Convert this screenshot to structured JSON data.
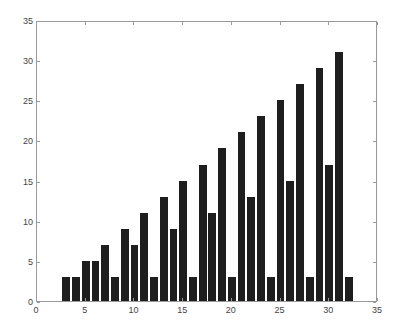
{
  "chart_data": {
    "type": "bar",
    "title": "",
    "xlabel": "",
    "ylabel": "",
    "x": [
      3,
      4,
      5,
      6,
      7,
      8,
      9,
      10,
      11,
      12,
      13,
      14,
      15,
      16,
      17,
      18,
      19,
      20,
      21,
      22,
      23,
      24,
      25,
      26,
      27,
      28,
      29,
      30,
      31,
      32
    ],
    "values": [
      3,
      3,
      5,
      5,
      7,
      3,
      9,
      7,
      11,
      3,
      13,
      9,
      15,
      3,
      17,
      11,
      19,
      3,
      21,
      13,
      23,
      3,
      25,
      15,
      27,
      3,
      29,
      17,
      31,
      3
    ],
    "xlim": [
      0,
      35
    ],
    "ylim": [
      0,
      35
    ],
    "xticks": [
      "0",
      "5",
      "10",
      "15",
      "20",
      "25",
      "30",
      "35"
    ],
    "yticks": [
      "0",
      "5",
      "10",
      "15",
      "20",
      "25",
      "30",
      "35"
    ],
    "grid": false,
    "bar_color": "#1e1e1e"
  }
}
